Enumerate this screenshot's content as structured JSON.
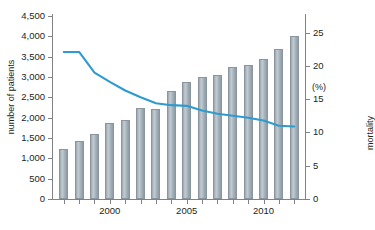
{
  "chart_data": {
    "type": "bar",
    "title": "",
    "annotation": "In-hospital mortality>10%",
    "xlabel": "",
    "ylabel": "number of patients",
    "y2label": "mortality",
    "y2unit": "(%)",
    "grid": false,
    "legend": "none",
    "ylim": [
      0,
      4500
    ],
    "y2lim": [
      0,
      27.5
    ],
    "xlim": [
      1996.3,
      2012.7
    ],
    "yticks": [
      "0",
      "500",
      "1,000",
      "1,500",
      "2,000",
      "2,500",
      "3,000",
      "3,500",
      "4,000",
      "4,500"
    ],
    "y2ticks": [
      "0",
      "5",
      "10",
      "15",
      "20",
      "25"
    ],
    "xticks": [
      "2000",
      "2005",
      "2010"
    ],
    "categories": [
      1997,
      1998,
      1999,
      2000,
      2001,
      2002,
      2003,
      2004,
      2005,
      2006,
      2007,
      2008,
      2009,
      2010,
      2011,
      2012
    ],
    "series": [
      {
        "name": "number of patients",
        "type": "bar",
        "axis": "left",
        "values": [
          1220,
          1420,
          1600,
          1870,
          1950,
          2230,
          2220,
          2660,
          2870,
          2990,
          3060,
          3250,
          3290,
          3450,
          3680,
          4000
        ]
      },
      {
        "name": "In-hospital mortality>10%",
        "type": "line",
        "axis": "right",
        "color": "#2e9bd0",
        "values": [
          22.1,
          22.1,
          19.0,
          17.6,
          16.3,
          15.3,
          14.4,
          14.1,
          14.0,
          13.3,
          12.8,
          12.5,
          12.2,
          11.8,
          11.0,
          10.9
        ]
      }
    ]
  }
}
